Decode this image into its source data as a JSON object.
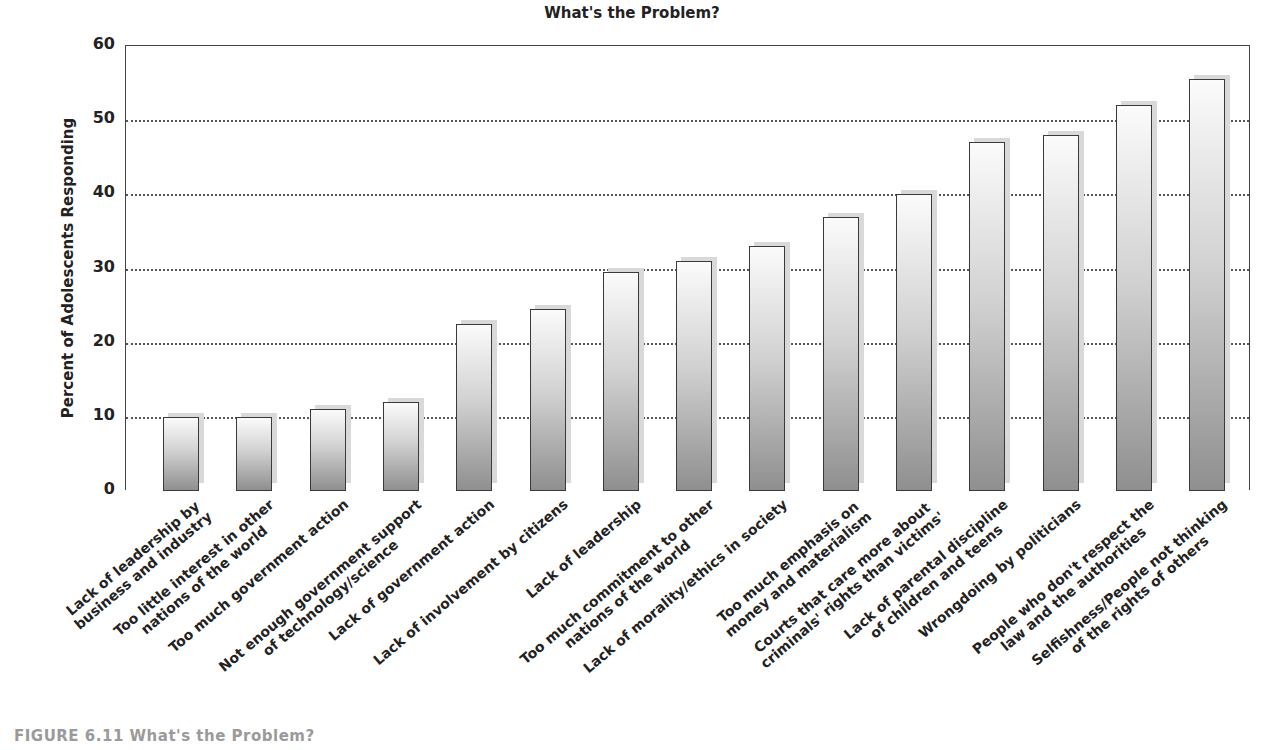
{
  "chart_data": {
    "type": "bar",
    "title": "What's the Problem?",
    "xlabel": "",
    "ylabel": "Percent of Adolescents Responding",
    "ylim": [
      0,
      60
    ],
    "yticks": [
      0,
      10,
      20,
      30,
      40,
      50,
      60
    ],
    "grid": "horizontal dotted",
    "legend": null,
    "categories": [
      "Lack of leadership by business and industry",
      "Too little interest in other nations of the world",
      "Too much government action",
      "Not enough government support of technology/science",
      "Lack of government action",
      "Lack of involvement by citizens",
      "Lack of leadership",
      "Too much commitment to other nations of the world",
      "Lack of morality/ethics in society",
      "Too much emphasis on money and materialism",
      "Courts that care more about criminals' rights than victims'",
      "Lack of parental discipline of children and teens",
      "Wrongdoing by politicians",
      "People who don't respect the law and the authorities",
      "Selfishness/People not thinking of the rights of others"
    ],
    "label_lines": [
      [
        "Lack of leadership by",
        "business and industry"
      ],
      [
        "Too little interest in other",
        "nations of the world"
      ],
      [
        "Too much government action"
      ],
      [
        "Not enough government support",
        "of technology/science"
      ],
      [
        "Lack of government action"
      ],
      [
        "Lack of involvement by citizens"
      ],
      [
        "Lack of leadership"
      ],
      [
        "Too much commitment to other",
        "nations of the world"
      ],
      [
        "Lack of morality/ethics in society"
      ],
      [
        "Too much emphasis on",
        "money and materialism"
      ],
      [
        "Courts that care more about",
        "criminals' rights than victims'"
      ],
      [
        "Lack of parental discipline",
        "of children and teens"
      ],
      [
        "Wrongdoing by politicians"
      ],
      [
        "People who don't respect the",
        "law and the authorities"
      ],
      [
        "Selfishness/People not thinking",
        "of the rights of others"
      ]
    ],
    "values": [
      10,
      10,
      11,
      12,
      22.5,
      24.5,
      29.5,
      31,
      33,
      37,
      40,
      47,
      48,
      52,
      55.5
    ]
  },
  "caption": "FIGURE 6.11  What's the Problem?"
}
